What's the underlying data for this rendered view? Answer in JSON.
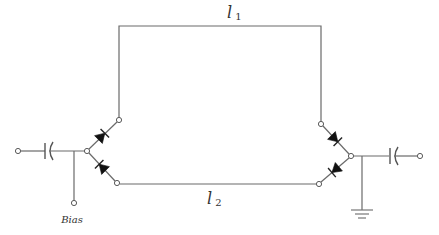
{
  "diagram": {
    "type": "circuit-schematic",
    "labels": {
      "line1_letter": "l",
      "line1_sub": "1",
      "line2_letter": "l",
      "line2_sub": "2",
      "bias": "Bias"
    },
    "components": [
      {
        "id": "input-terminal",
        "kind": "terminal"
      },
      {
        "id": "input-capacitor",
        "kind": "dc-block-capacitor"
      },
      {
        "id": "bias-terminal",
        "kind": "terminal",
        "label": "Bias"
      },
      {
        "id": "diode-left-upper",
        "kind": "pin-diode"
      },
      {
        "id": "diode-left-lower",
        "kind": "pin-diode"
      },
      {
        "id": "line-l1",
        "kind": "transmission-line",
        "label": "l1"
      },
      {
        "id": "line-l2",
        "kind": "transmission-line",
        "label": "l2"
      },
      {
        "id": "diode-right-upper",
        "kind": "pin-diode"
      },
      {
        "id": "diode-right-lower",
        "kind": "pin-diode"
      },
      {
        "id": "ground",
        "kind": "ground"
      },
      {
        "id": "output-capacitor",
        "kind": "dc-block-capacitor"
      },
      {
        "id": "output-terminal",
        "kind": "terminal"
      }
    ],
    "colors": {
      "wire": "#6a6a6a",
      "diode": "#111111",
      "background": "#ffffff"
    }
  }
}
